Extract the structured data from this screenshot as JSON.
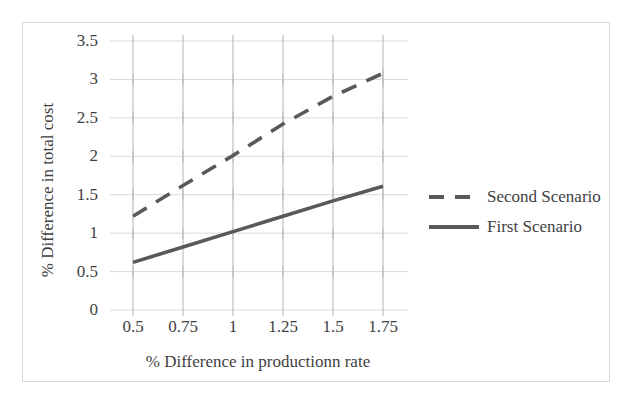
{
  "chart_data": {
    "type": "line",
    "title": "",
    "xlabel": "% Difference in productionn rate",
    "ylabel": "% Difference in total cost",
    "x": [
      0.5,
      0.75,
      1,
      1.25,
      1.5,
      1.75
    ],
    "xticklabels": [
      "0.5",
      "0.75",
      "1",
      "1.25",
      "1.5",
      "1.75"
    ],
    "yticklabels": [
      "0",
      "0.5",
      "1",
      "1.5",
      "2",
      "2.5",
      "3",
      "3.5"
    ],
    "ylim": [
      0,
      3.5
    ],
    "yticks": [
      0,
      0.5,
      1,
      1.5,
      2,
      2.5,
      3,
      3.5
    ],
    "grid": "horizontal-and-vertical-ticks",
    "legend_position": "right",
    "series": [
      {
        "name": "Second Scenario",
        "style": "dashed",
        "color": "#595959",
        "values": [
          1.22,
          1.62,
          2.01,
          2.42,
          2.78,
          3.08
        ]
      },
      {
        "name": "First Scenario",
        "style": "solid",
        "color": "#595959",
        "values": [
          0.62,
          0.82,
          1.02,
          1.22,
          1.42,
          1.61
        ]
      }
    ]
  },
  "legend": {
    "items": [
      {
        "label": "Second Scenario",
        "style": "dashed"
      },
      {
        "label": "First Scenario",
        "style": "solid"
      }
    ]
  },
  "axes": {
    "y_title": "% Difference in total cost",
    "x_title": "% Difference in productionn rate",
    "y_ticks": [
      "3.5",
      "3",
      "2.5",
      "2",
      "1.5",
      "1",
      "0.5",
      "0"
    ],
    "x_ticks": [
      "0.5",
      "0.75",
      "1",
      "1.25",
      "1.5",
      "1.75"
    ]
  },
  "colors": {
    "series_line": "#595959",
    "gridline": "#d9d9d9",
    "tick_mark": "#bfbfbf",
    "frame": "#d8d8d8",
    "text": "#3f3f3f"
  }
}
